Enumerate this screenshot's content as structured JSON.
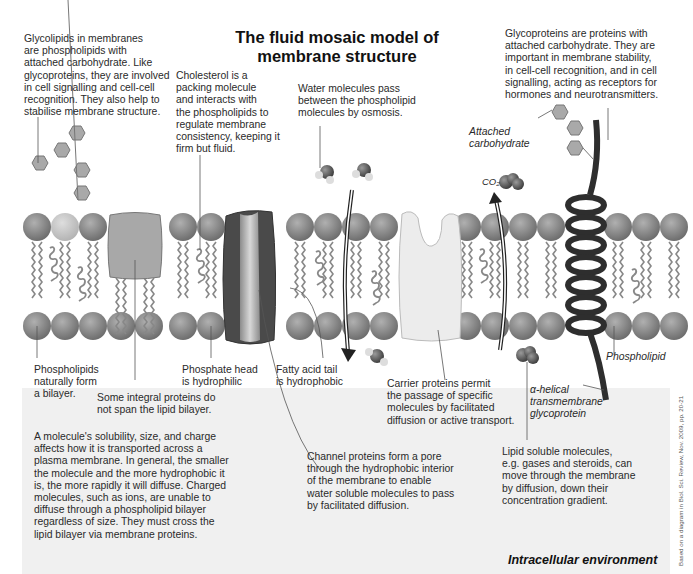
{
  "title": "The fluid mosaic model of\nmembrane structure",
  "labels": {
    "glycolipids": "Glycolipids in membranes\nare phospholipids with\nattached carbohydrate. Like\nglycoproteins, they are involved\nin cell signalling and cell-cell\nrecognition. They also help to\nstabilise membrane structure.",
    "cholesterol": "Cholesterol is a\npacking molecule\nand interacts with\nthe phospholipids to\nregulate membrane\nconsistency, keeping it\nfirm but fluid.",
    "water": "Water molecules pass\nbetween the phospholipid\nmolecules by osmosis.",
    "glycoproteins": "Glycoproteins are proteins with\nattached carbohydrate. They are\nimportant in membrane stability,\nin cell-cell recognition, and in cell\nsignalling, acting as receptors for\nhormones and neurotransmitters.",
    "attached_carbohydrate": "Attached\ncarbohydrate",
    "co2": "CO₂",
    "phospholipids_bilayer": "Phospholipids\nnaturally form\na bilayer.",
    "integral_proteins": "Some integral proteins do\nnot span the lipid bilayer.",
    "phosphate_head": "Phosphate head\nis hydrophilic",
    "fatty_acid_tail": "Fatty acid tail\nis hydrophobic",
    "carrier_proteins": "Carrier proteins permit\nthe passage of specific\nmolecules by facilitated\ndiffusion or active transport.",
    "phospholipid": "Phospholipid",
    "alpha_helical": "α-helical\ntransmembrane\nglycoprotein",
    "solubility": "A molecule's solubility, size, and charge\naffects how it is transported across a\nplasma membrane. In general, the smaller\nthe molecule and the more hydrophobic it\nis, the more rapidly it will diffuse. Charged\nmolecules, such as ions, are unable to\ndiffuse through a phospholipid bilayer\nregardless of size. They must cross the\nlipid bilayer via membrane proteins.",
    "channel_proteins": "Channel proteins form a pore\nthrough the hydrophobic interior\nof the membrane to enable\nwater soluble molecules to pass\nby facilitated diffusion.",
    "lipid_soluble": "Lipid soluble molecules,\ne.g. gases and steroids, can\nmove through the membrane\nby diffusion, down their\nconcentration gradient.",
    "intracellular": "Intracellular environment",
    "credit": "Based on a diagram in Biol. Sci. Review, Nov. 2009, pp. 20-21"
  },
  "colors": {
    "phospholipid_head": "#8a8a8a",
    "glycolipid_head": "#c4c4c4",
    "channel_protein_outer": "#4a4a4a",
    "channel_protein_inner": "#b5b5b5",
    "carrier_protein": "#ececec",
    "helix": "#2e2e2e",
    "carbohydrate_hex": "#a9a9a9",
    "lower_background": "#f0f0f0"
  }
}
